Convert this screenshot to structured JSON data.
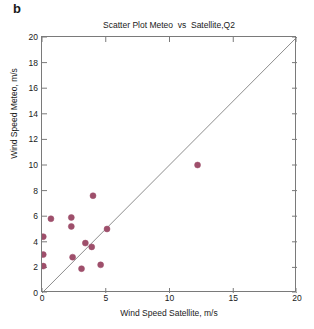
{
  "figure": {
    "panel_label": "b",
    "background_color": "#ffffff",
    "axis_color": "#7a7a7a",
    "text_color": "#1a1a1a"
  },
  "chart_data": {
    "type": "scatter",
    "title": "Scatter Plot Meteo  vs  Satellite,Q2",
    "xlabel": "Wind Speed Satellite, m/s",
    "ylabel": "Wind Speed Meteo, m/s",
    "xlim": [
      0,
      20
    ],
    "ylim": [
      0,
      20
    ],
    "xticks": [
      0,
      5,
      10,
      15,
      20
    ],
    "yticks": [
      0,
      2,
      4,
      6,
      8,
      10,
      12,
      14,
      16,
      18,
      20
    ],
    "xtick_labels": [
      "0",
      "5",
      "10",
      "15",
      "20"
    ],
    "ytick_labels": [
      "0",
      "2",
      "4",
      "6",
      "8",
      "10",
      "12",
      "14",
      "16",
      "18",
      "20"
    ],
    "grid": false,
    "legend": null,
    "marker_color": "#9e4f6b",
    "marker_size_px": 6,
    "identity_line": {
      "label": "1:1 line",
      "from": [
        0,
        0
      ],
      "to": [
        20,
        20
      ],
      "color": "#808080"
    },
    "points": [
      {
        "x": 0.1,
        "y": 4.4
      },
      {
        "x": 0.1,
        "y": 3.0
      },
      {
        "x": 0.1,
        "y": 2.1
      },
      {
        "x": 0.7,
        "y": 5.8
      },
      {
        "x": 2.3,
        "y": 5.9
      },
      {
        "x": 2.3,
        "y": 5.2
      },
      {
        "x": 2.4,
        "y": 2.8
      },
      {
        "x": 3.1,
        "y": 1.9
      },
      {
        "x": 3.4,
        "y": 3.9
      },
      {
        "x": 3.9,
        "y": 3.6
      },
      {
        "x": 4.0,
        "y": 7.6
      },
      {
        "x": 4.6,
        "y": 2.2
      },
      {
        "x": 5.1,
        "y": 5.0
      },
      {
        "x": 12.2,
        "y": 10.0
      }
    ]
  }
}
